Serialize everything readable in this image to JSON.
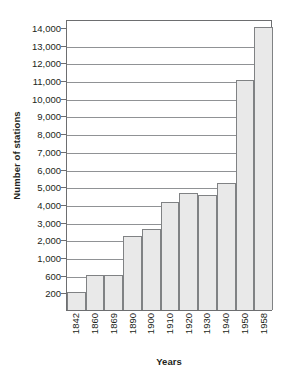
{
  "chart_data": {
    "type": "bar",
    "title": "",
    "xlabel": "Years",
    "ylabel": "Number of stations",
    "categories": [
      "1842",
      "1860",
      "1869",
      "1890",
      "1900",
      "1910",
      "1920",
      "1930",
      "1940",
      "1950",
      "1958"
    ],
    "values": [
      200,
      600,
      600,
      2200,
      2600,
      4100,
      4600,
      4500,
      5200,
      11000,
      14000
    ],
    "ytick_labels": [
      "14,000",
      "13,000",
      "12,000",
      "11,000",
      "10,000",
      "9,000",
      "8,000",
      "7,000",
      "6,000",
      "5,000",
      "4,000",
      "3,000",
      "2,000",
      "1,000",
      "600",
      "200"
    ],
    "ytick_values": [
      14000,
      13000,
      12000,
      11000,
      10000,
      9000,
      8000,
      7000,
      6000,
      5000,
      4000,
      3000,
      2000,
      1000,
      600,
      200
    ],
    "ylim": [
      0,
      14000
    ],
    "grid": true,
    "legend": "none",
    "bar_fill_color": "#e9e9e9",
    "bar_border_color": "#808284",
    "axis_color": "#6d6e70",
    "grid_color": "#909295",
    "text_color": "#231f20"
  }
}
